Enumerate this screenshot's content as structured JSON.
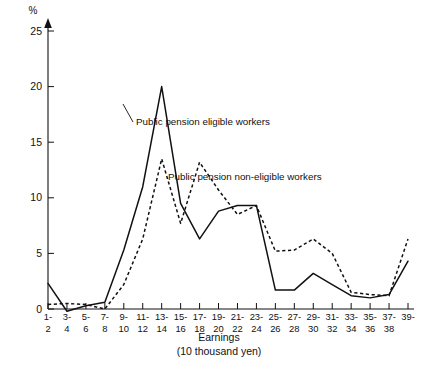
{
  "chart_data": {
    "type": "line",
    "title": "",
    "xlabel": "Earnings",
    "xlabel_sub": "(10 thousand yen)",
    "ylabel": "%",
    "ylim": [
      0,
      25
    ],
    "yticks": [
      0,
      5,
      10,
      15,
      20,
      25
    ],
    "ytick_labels": [
      "0",
      "5",
      "10",
      "15",
      "20",
      "25"
    ],
    "grid": false,
    "legend_position": "inline-annotation",
    "categories": [
      "1-\n2",
      "3-\n4",
      "5-\n6",
      "7-\n8",
      "9-\n10",
      "11-\n12",
      "13-\n14",
      "15-\n16",
      "17-\n18",
      "19-\n20",
      "21-\n22",
      "23-\n24",
      "25-\n26",
      "27-\n28",
      "29-\n30",
      "31-\n32",
      "33-\n34",
      "35-\n36",
      "37-\n38",
      "39-\n"
    ],
    "categories_top": [
      "1-",
      "3-",
      "5-",
      "7-",
      "9-",
      "11-",
      "13-",
      "15-",
      "17-",
      "19-",
      "21-",
      "23-",
      "25-",
      "27-",
      "29-",
      "31-",
      "33-",
      "35-",
      "37-",
      "39-"
    ],
    "categories_bottom": [
      "2",
      "4",
      "6",
      "8",
      "10",
      "12",
      "14",
      "16",
      "18",
      "20",
      "22",
      "24",
      "26",
      "28",
      "30",
      "32",
      "34",
      "36",
      "38",
      ""
    ],
    "series": [
      {
        "name": "Public pension eligible workers",
        "style": "solid",
        "color": "#111111",
        "values": [
          2.3,
          -0.2,
          0.3,
          0.6,
          5.3,
          11.0,
          20.0,
          9.5,
          6.3,
          8.8,
          9.3,
          9.3,
          1.7,
          1.7,
          3.2,
          2.2,
          1.2,
          1.0,
          1.3,
          4.3
        ]
      },
      {
        "name": "Public pension non-eligible workers",
        "style": "dashed",
        "color": "#111111",
        "values": [
          0.4,
          0.5,
          0.4,
          0.0,
          2.2,
          6.3,
          13.5,
          7.7,
          13.2,
          10.7,
          8.5,
          9.3,
          5.2,
          5.3,
          6.3,
          5.0,
          1.5,
          1.3,
          1.2,
          6.3
        ]
      }
    ],
    "annotations": [
      {
        "text": "Public pension eligible workers",
        "x": 136,
        "y": 125
      },
      {
        "text": "Public pension non-eligible workers",
        "x": 168,
        "y": 180
      }
    ]
  }
}
